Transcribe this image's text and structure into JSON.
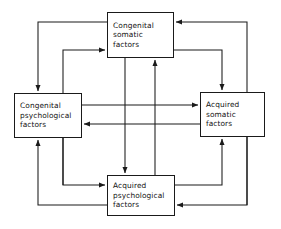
{
  "diagram": {
    "type": "block-flow-diagram",
    "title": "",
    "stroke_color": "#1a1a1a",
    "background_color": "#ffffff",
    "nodes": [
      {
        "id": "congenital-somatic",
        "lines": [
          "Congenital",
          "somatic",
          "factors"
        ]
      },
      {
        "id": "congenital-psychological",
        "lines": [
          "Congenital",
          "psychological",
          "factors"
        ]
      },
      {
        "id": "acquired-somatic",
        "lines": [
          "Acquired",
          "somatic",
          "factors"
        ]
      },
      {
        "id": "acquired-psychological",
        "lines": [
          "Acquired",
          "psychological",
          "factors"
        ]
      }
    ],
    "edges": [
      {
        "from": "congenital-somatic",
        "to": "congenital-psychological",
        "route": "outer-left"
      },
      {
        "from": "congenital-psychological",
        "to": "congenital-somatic",
        "route": "inner-left"
      },
      {
        "from": "congenital-somatic",
        "to": "acquired-somatic",
        "route": "inner-right"
      },
      {
        "from": "acquired-somatic",
        "to": "congenital-somatic",
        "route": "outer-right-up"
      },
      {
        "from": "congenital-psychological",
        "to": "acquired-psychological",
        "route": "inner-bottom-left"
      },
      {
        "from": "acquired-psychological",
        "to": "congenital-psychological",
        "route": "outer-bottom-left"
      },
      {
        "from": "acquired-psychological",
        "to": "acquired-somatic",
        "route": "inner-bottom-right"
      },
      {
        "from": "acquired-somatic",
        "to": "acquired-psychological",
        "route": "outer-bottom-right"
      },
      {
        "from": "congenital-psychological",
        "to": "acquired-somatic",
        "route": "center-horizontal-right"
      },
      {
        "from": "acquired-somatic",
        "to": "congenital-psychological",
        "route": "center-horizontal-left"
      },
      {
        "from": "congenital-somatic",
        "to": "acquired-psychological",
        "route": "center-vertical-down"
      },
      {
        "from": "acquired-psychological",
        "to": "congenital-somatic",
        "route": "center-vertical-up"
      }
    ]
  }
}
